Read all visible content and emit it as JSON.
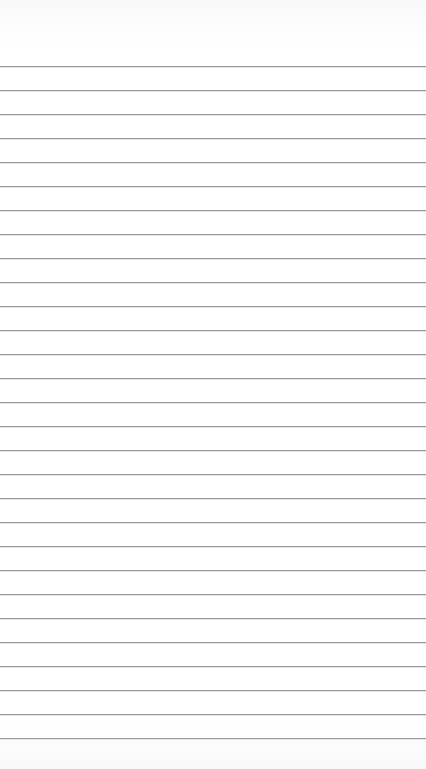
{
  "paper": {
    "type": "lined-paper",
    "line_color": "#9c9c9c",
    "background_color": "#ffffff",
    "first_line_y": 66,
    "line_spacing": 24,
    "line_count": 29
  }
}
